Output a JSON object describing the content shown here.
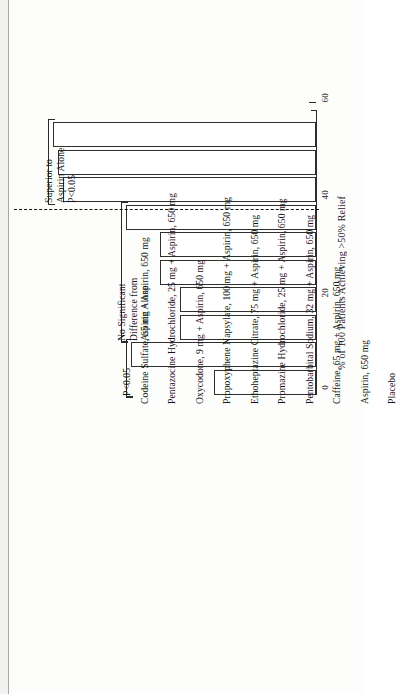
{
  "figure": {
    "axis_title": "% of 100 Patients Achieving >50% Relief",
    "reference_line_label": "Aspirin Alone reference",
    "background": "#fdfdfc",
    "ink": "#2f2f2f"
  },
  "axis": {
    "major_ticks": [
      "0",
      "20",
      "40",
      "60"
    ],
    "major_values": [
      0,
      20,
      40,
      60
    ],
    "minor_values": [
      10,
      30,
      50
    ],
    "min": 0,
    "max": 62
  },
  "annotations": [
    {
      "id": "group-superior",
      "text": "Superior to\nAspirin Alone\nP<0.05",
      "bars": [
        0,
        1,
        2
      ]
    },
    {
      "id": "group-nosig",
      "text": "No Significant\nDifference from\nAspirin Alone",
      "bars": [
        3,
        4,
        5,
        6,
        7
      ]
    },
    {
      "id": "group-placebo",
      "text": "P<0.05",
      "bars": [
        8,
        9
      ]
    }
  ],
  "chart_data": {
    "type": "bar",
    "title": "",
    "subtitle": "",
    "orientation": "horizontal",
    "xlabel": "",
    "ylabel": "% of 100 Patients Achieving >50% Relief",
    "ylim": [
      0,
      62
    ],
    "grid": false,
    "legend": "none",
    "reference_line": {
      "value": 38,
      "style": "dashed",
      "label": "Aspirin, 650 mg"
    },
    "categories": [
      "Codeine Sulfate, 65 mg + Aspirin, 650 mg",
      "Pentazocine Hydrochloride, 25 mg + Aspirin, 650 mg",
      "Oxycodone, 9 mg + Aspirin, 650 mg",
      "Propoxyphene Napsylate, 100 mg + Aspirin, 650 mg",
      "Ethoheptazine Citrate, 75 mg + Aspirin, 650 mg",
      "Promazine Hydrochloride, 25 mg + Aspirin, 650 mg",
      "Pentobarbital Sodium, 32 mg + Aspirin, 650 mg",
      "Caffeine, 65 mg + Aspirin, 650 mg",
      "Aspirin, 650 mg",
      "Placebo"
    ],
    "values": [
      54,
      53,
      52,
      39,
      32,
      32,
      28,
      28,
      38,
      21
    ],
    "groups": [
      {
        "name": "Superior to Aspirin Alone P<0.05",
        "indices": [
          0,
          1,
          2
        ]
      },
      {
        "name": "No Significant Difference from Aspirin Alone",
        "indices": [
          3,
          4,
          5,
          6,
          7
        ]
      },
      {
        "name": "P<0.05",
        "indices": [
          8,
          9
        ]
      }
    ]
  }
}
